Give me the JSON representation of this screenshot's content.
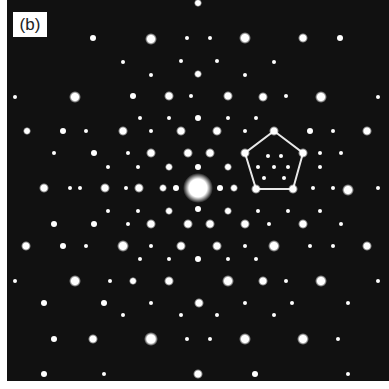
{
  "figure": {
    "label": "(b)",
    "colors": {
      "background": "#111111",
      "spot": "#ffffff",
      "outline": "#e8e8e8",
      "border": "#ffffff"
    },
    "center": [
      198,
      188
    ],
    "center_radius": 15,
    "pentagon": [
      [
        274,
        131
      ],
      [
        303,
        153
      ],
      [
        293,
        189
      ],
      [
        256,
        189
      ],
      [
        245,
        153
      ]
    ],
    "spots": [
      [
        151,
        39,
        6
      ],
      [
        245,
        38,
        6
      ],
      [
        303,
        38,
        5
      ],
      [
        198,
        3,
        4
      ],
      [
        93,
        38,
        3
      ],
      [
        340,
        38,
        3
      ],
      [
        187,
        38,
        2
      ],
      [
        210,
        38,
        2
      ],
      [
        75,
        97,
        6
      ],
      [
        169,
        96,
        5
      ],
      [
        228,
        96,
        5
      ],
      [
        263,
        97,
        5
      ],
      [
        321,
        97,
        6
      ],
      [
        133,
        96,
        3
      ],
      [
        191,
        96,
        2
      ],
      [
        286,
        96,
        2
      ],
      [
        15,
        97,
        2
      ],
      [
        378,
        97,
        2
      ],
      [
        198,
        74,
        4
      ],
      [
        123,
        62,
        2
      ],
      [
        274,
        62,
        2
      ],
      [
        181,
        61,
        2
      ],
      [
        217,
        61,
        2
      ],
      [
        151,
        75,
        2
      ],
      [
        245,
        75,
        2
      ],
      [
        27,
        131,
        4
      ],
      [
        123,
        131,
        5
      ],
      [
        181,
        131,
        5
      ],
      [
        217,
        131,
        5
      ],
      [
        367,
        131,
        5
      ],
      [
        63,
        131,
        3
      ],
      [
        86,
        131,
        2
      ],
      [
        151,
        131,
        2
      ],
      [
        245,
        131,
        2
      ],
      [
        310,
        131,
        3
      ],
      [
        333,
        131,
        2
      ],
      [
        198,
        118,
        3
      ],
      [
        169,
        118,
        2
      ],
      [
        228,
        118,
        2
      ],
      [
        256,
        118,
        2
      ],
      [
        140,
        118,
        2
      ],
      [
        54,
        153,
        2
      ],
      [
        94,
        153,
        3
      ],
      [
        151,
        153,
        5
      ],
      [
        188,
        153,
        5
      ],
      [
        210,
        153,
        5
      ],
      [
        128,
        153,
        2
      ],
      [
        320,
        153,
        2
      ],
      [
        341,
        153,
        2
      ],
      [
        169,
        167,
        4
      ],
      [
        228,
        167,
        4
      ],
      [
        108,
        167,
        2
      ],
      [
        138,
        167,
        2
      ],
      [
        258,
        167,
        2
      ],
      [
        288,
        167,
        2
      ],
      [
        320,
        167,
        2
      ],
      [
        44,
        188,
        5
      ],
      [
        105,
        188,
        5
      ],
      [
        139,
        188,
        5
      ],
      [
        163,
        188,
        4
      ],
      [
        234,
        188,
        4
      ],
      [
        348,
        190,
        6
      ],
      [
        70,
        188,
        2
      ],
      [
        80,
        188,
        2
      ],
      [
        126,
        188,
        2
      ],
      [
        176,
        188,
        3
      ],
      [
        220,
        188,
        3
      ],
      [
        313,
        188,
        2
      ],
      [
        333,
        188,
        2
      ],
      [
        378,
        188,
        2
      ],
      [
        198,
        167,
        3
      ],
      [
        198,
        209,
        3
      ],
      [
        268,
        156,
        2
      ],
      [
        281,
        156,
        2
      ],
      [
        274,
        167,
        2
      ],
      [
        264,
        178,
        2
      ],
      [
        284,
        178,
        2
      ],
      [
        169,
        211,
        4
      ],
      [
        228,
        211,
        4
      ],
      [
        108,
        211,
        2
      ],
      [
        138,
        211,
        2
      ],
      [
        258,
        211,
        2
      ],
      [
        288,
        211,
        2
      ],
      [
        320,
        211,
        2
      ],
      [
        54,
        224,
        3
      ],
      [
        94,
        224,
        3
      ],
      [
        151,
        224,
        5
      ],
      [
        188,
        224,
        5
      ],
      [
        210,
        224,
        5
      ],
      [
        245,
        224,
        5
      ],
      [
        303,
        224,
        5
      ],
      [
        128,
        224,
        2
      ],
      [
        269,
        224,
        2
      ],
      [
        341,
        224,
        2
      ],
      [
        26,
        246,
        5
      ],
      [
        123,
        246,
        6
      ],
      [
        181,
        246,
        5
      ],
      [
        217,
        246,
        5
      ],
      [
        274,
        246,
        6
      ],
      [
        367,
        246,
        5
      ],
      [
        63,
        246,
        3
      ],
      [
        86,
        246,
        2
      ],
      [
        151,
        246,
        2
      ],
      [
        245,
        246,
        2
      ],
      [
        310,
        246,
        2
      ],
      [
        333,
        246,
        2
      ],
      [
        198,
        259,
        3
      ],
      [
        169,
        259,
        2
      ],
      [
        228,
        259,
        2
      ],
      [
        140,
        259,
        2
      ],
      [
        256,
        259,
        2
      ],
      [
        75,
        281,
        6
      ],
      [
        169,
        281,
        5
      ],
      [
        228,
        281,
        6
      ],
      [
        263,
        281,
        5
      ],
      [
        321,
        281,
        6
      ],
      [
        133,
        281,
        4
      ],
      [
        110,
        281,
        2
      ],
      [
        286,
        281,
        2
      ],
      [
        15,
        281,
        2
      ],
      [
        378,
        281,
        2
      ],
      [
        44,
        303,
        3
      ],
      [
        104,
        303,
        3
      ],
      [
        199,
        303,
        5
      ],
      [
        151,
        303,
        2
      ],
      [
        245,
        303,
        2
      ],
      [
        292,
        303,
        2
      ],
      [
        348,
        303,
        2
      ],
      [
        123,
        315,
        2
      ],
      [
        274,
        315,
        2
      ],
      [
        181,
        315,
        2
      ],
      [
        217,
        315,
        2
      ],
      [
        93,
        339,
        5
      ],
      [
        151,
        339,
        7
      ],
      [
        245,
        339,
        6
      ],
      [
        303,
        339,
        6
      ],
      [
        54,
        339,
        3
      ],
      [
        187,
        339,
        2
      ],
      [
        210,
        339,
        2
      ],
      [
        338,
        339,
        2
      ],
      [
        198,
        374,
        5
      ],
      [
        44,
        374,
        3
      ],
      [
        104,
        374,
        2
      ],
      [
        255,
        374,
        3
      ],
      [
        348,
        374,
        2
      ]
    ]
  }
}
